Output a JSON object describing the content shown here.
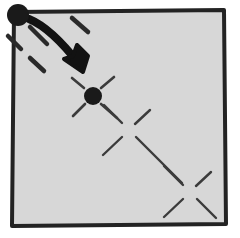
{
  "figure": {
    "width": 240,
    "height": 238,
    "background_color": "#ffffff"
  },
  "colors": {
    "page_background": "#ffffff",
    "panel_fill": "#d7d7d7",
    "frame_stroke": "#232323",
    "ink_dark": "#1a1a1a",
    "ink_mid": "#3b3b3b",
    "ink_light": "#4a4a4a"
  },
  "panel": {
    "name": "hand-drawn square frame",
    "fill": "#d7d7d7",
    "stroke": "#232323",
    "stroke_width": 4,
    "path": "M 14 12 L 224 10 L 226 224 L 12 226 Z"
  },
  "dots": [
    {
      "id": "dot-origin",
      "label": "origin dot",
      "cx": 18,
      "cy": 15,
      "r": 11,
      "fill": "#1a1a1a"
    },
    {
      "id": "dot-target",
      "label": "target dot",
      "cx": 93,
      "cy": 96,
      "r": 9,
      "fill": "#1a1a1a"
    }
  ],
  "sparkles": [
    {
      "id": "sparkle-1",
      "label": "sparkle at origin dot",
      "cx": 18,
      "cy": 15,
      "stroke": "#2a2a2a",
      "stroke_width": 4.5,
      "rays": [
        {
          "x1": 30,
          "y1": 27,
          "x2": 47,
          "y2": 44
        },
        {
          "x1": 8,
          "y1": 36,
          "x2": 21,
          "y2": 49
        },
        {
          "x1": 30,
          "y1": 58,
          "x2": 44,
          "y2": 71
        },
        {
          "x1": 72,
          "y1": 18,
          "x2": 88,
          "y2": 32
        }
      ]
    },
    {
      "id": "sparkle-2",
      "label": "sparkle at target dot",
      "cx": 93,
      "cy": 96,
      "stroke": "#3b3b3b",
      "stroke_width": 2.6,
      "rays": [
        {
          "x1": 101,
          "y1": 88,
          "x2": 114,
          "y2": 77
        },
        {
          "x1": 85,
          "y1": 104,
          "x2": 73,
          "y2": 116
        },
        {
          "x1": 101,
          "y1": 104,
          "x2": 117,
          "y2": 118
        },
        {
          "x1": 84,
          "y1": 88,
          "x2": 72,
          "y2": 78
        }
      ]
    },
    {
      "id": "sparkle-3",
      "label": "middle sparkle",
      "cx": 129,
      "cy": 130,
      "stroke": "#3b3b3b",
      "stroke_width": 2.4,
      "rays": [
        {
          "x1": 135,
          "y1": 124,
          "x2": 150,
          "y2": 110
        },
        {
          "x1": 122,
          "y1": 137,
          "x2": 103,
          "y2": 155
        },
        {
          "x1": 136,
          "y1": 137,
          "x2": 182,
          "y2": 183
        },
        {
          "x1": 122,
          "y1": 123,
          "x2": 104,
          "y2": 105
        }
      ]
    },
    {
      "id": "sparkle-4",
      "label": "lower-right sparkle",
      "cx": 190,
      "cy": 192,
      "stroke": "#3b3b3b",
      "stroke_width": 2.4,
      "rays": [
        {
          "x1": 196,
          "y1": 186,
          "x2": 211,
          "y2": 172
        },
        {
          "x1": 183,
          "y1": 199,
          "x2": 164,
          "y2": 217
        },
        {
          "x1": 197,
          "y1": 199,
          "x2": 216,
          "y2": 218
        },
        {
          "x1": 183,
          "y1": 185,
          "x2": 164,
          "y2": 166
        }
      ]
    }
  ],
  "arrow": {
    "id": "motion-arrow",
    "label": "bold curved arrow from origin dot to target dot",
    "stroke": "#121212",
    "stroke_width": 8,
    "shaft_path": "M 29 19 C 46 26 62 42 79 64",
    "head_points": "86 76 62 62 72 57 78 46 87 52",
    "head_path": "M 83 72 L 64 59 L 73 56 L 77 45 L 88 56 Z"
  }
}
